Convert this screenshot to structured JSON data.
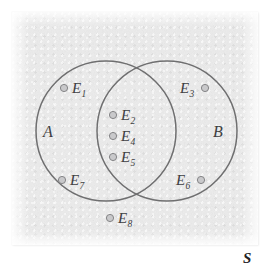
{
  "figure": {
    "type": "venn-diagram",
    "background_color": "#ececec",
    "circle_stroke_color": "#6f6f70",
    "dot_fill_color": "#c9c9cb",
    "dot_stroke_color": "#7c7c7e",
    "text_color": "#3f3f42"
  },
  "sets": [
    {
      "name": "set-a",
      "label": "A",
      "cx": 106,
      "cy": 131,
      "r": 70
    },
    {
      "name": "set-b",
      "label": "B",
      "cx": 167,
      "cy": 131,
      "r": 70
    }
  ],
  "set_labels": [
    {
      "name": "set-label-a",
      "text": "A",
      "x": 43,
      "y": 124
    },
    {
      "name": "set-label-b",
      "text": "B",
      "x": 213,
      "y": 124
    }
  ],
  "universe": {
    "name": "sample-space-label",
    "text": "S",
    "x": 243,
    "y": 251
  },
  "points": [
    {
      "name": "point-e1",
      "base": "E",
      "sub": "1",
      "region": "A only",
      "dot": {
        "cx": 64,
        "cy": 88
      },
      "label": {
        "x": 72,
        "y": 81
      },
      "label_side": "right"
    },
    {
      "name": "point-e2",
      "base": "E",
      "sub": "2",
      "region": "A and B",
      "dot": {
        "cx": 113,
        "cy": 115
      },
      "label": {
        "x": 121,
        "y": 108
      },
      "label_side": "right"
    },
    {
      "name": "point-e3",
      "base": "E",
      "sub": "3",
      "region": "B only",
      "dot": {
        "cx": 205,
        "cy": 88
      },
      "label": {
        "x": 180,
        "y": 81
      },
      "label_side": "left"
    },
    {
      "name": "point-e4",
      "base": "E",
      "sub": "4",
      "region": "A and B",
      "dot": {
        "cx": 113,
        "cy": 136
      },
      "label": {
        "x": 121,
        "y": 129
      },
      "label_side": "right"
    },
    {
      "name": "point-e5",
      "base": "E",
      "sub": "5",
      "region": "A and B",
      "dot": {
        "cx": 113,
        "cy": 157
      },
      "label": {
        "x": 121,
        "y": 150
      },
      "label_side": "right"
    },
    {
      "name": "point-e6",
      "base": "E",
      "sub": "6",
      "region": "B only",
      "dot": {
        "cx": 201,
        "cy": 180
      },
      "label": {
        "x": 176,
        "y": 173
      },
      "label_side": "left"
    },
    {
      "name": "point-e7",
      "base": "E",
      "sub": "7",
      "region": "A only",
      "dot": {
        "cx": 62,
        "cy": 180
      },
      "label": {
        "x": 70,
        "y": 173
      },
      "label_side": "right"
    },
    {
      "name": "point-e8",
      "base": "E",
      "sub": "8",
      "region": "outside A and B",
      "dot": {
        "cx": 110,
        "cy": 218
      },
      "label": {
        "x": 118,
        "y": 211
      },
      "label_side": "right"
    }
  ]
}
